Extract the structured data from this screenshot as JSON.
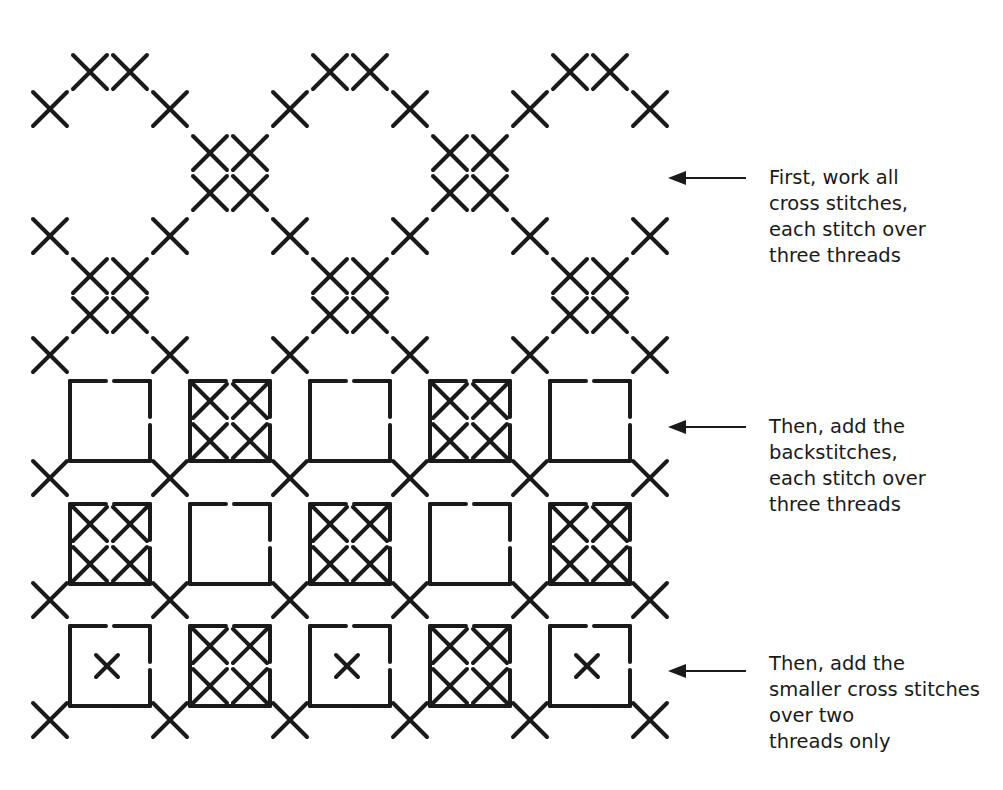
{
  "diagram": {
    "stroke_color": "#1a1a1a",
    "background": "#ffffff",
    "annotations": [
      {
        "step": 1,
        "lines": [
          "First, work all",
          "cross stitches,",
          "each stitch over",
          "three threads"
        ],
        "arrow_y": 178
      },
      {
        "step": 2,
        "lines": [
          "Then, add the",
          "backstitches,",
          "each stitch over",
          "three threads"
        ],
        "arrow_y": 427
      },
      {
        "step": 3,
        "lines": [
          "Then, add the",
          "smaller cross stitches",
          "over two",
          "threads only"
        ],
        "arrow_y": 671
      }
    ],
    "grid": {
      "columns_x": [
        50,
        170,
        290,
        410,
        530,
        650
      ],
      "large_cross_rows_y": [
        109,
        236,
        355,
        478,
        600,
        720
      ],
      "box_rows": [
        {
          "label": "row-a",
          "pattern": [
            "empty",
            "filled",
            "empty",
            "filled",
            "empty"
          ]
        },
        {
          "label": "row-b",
          "pattern": [
            "filled",
            "empty",
            "filled",
            "empty",
            "filled"
          ]
        },
        {
          "label": "row-c",
          "pattern": [
            "small-cross",
            "filled",
            "small-cross",
            "filled",
            "small-cross"
          ]
        }
      ]
    }
  }
}
